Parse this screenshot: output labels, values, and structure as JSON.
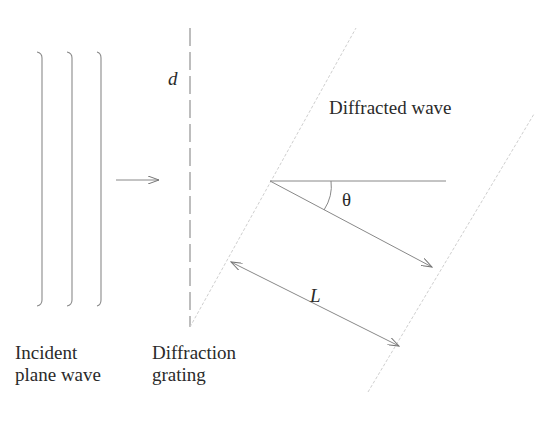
{
  "diagram": {
    "labels": {
      "incident_line1": "Incident",
      "incident_line2": "plane wave",
      "grating_line1": "Diffraction",
      "grating_line2": "grating",
      "diffracted": "Diffracted wave",
      "spacing": "d",
      "angle": "θ",
      "length": "L"
    },
    "colors": {
      "line": "#777777",
      "light_dashed": "#c8c8c8",
      "text": "#2a2a2a"
    },
    "elements": {
      "incident_wavefronts_x": [
        42,
        72,
        101
      ],
      "grating_x": 190,
      "ray_angle_deg": 28
    }
  }
}
